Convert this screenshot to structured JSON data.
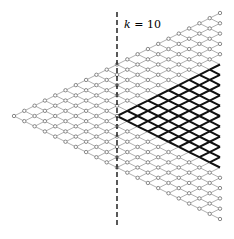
{
  "diagram": {
    "type": "triangular-lattice",
    "columns": 21,
    "origin": {
      "x": 14,
      "y": 116
    },
    "dx": 10.3,
    "dy": 5.15,
    "grid_color": "#9a9a9a",
    "node_color": "#7a7a7a",
    "bold_color": "#111111",
    "bold_start_column": 10,
    "bold_start_offset": 0,
    "divider": {
      "column": 10,
      "label": "k = 10",
      "y_top": 12,
      "y_bottom": 228
    }
  }
}
